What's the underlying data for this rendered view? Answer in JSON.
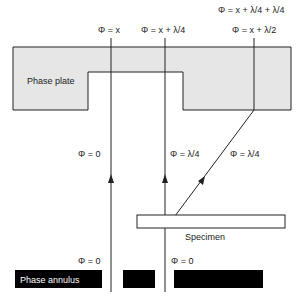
{
  "diagram": {
    "labels": {
      "phase_plate": "Phase plate",
      "specimen": "Specimen",
      "phase_annulus": "Phase annulus"
    },
    "top_phases": {
      "left": "Φ = x",
      "middle": "Φ = x + λ/4",
      "right": "Φ = x + λ/2",
      "far_right": "Φ = x + λ/4 + λ/4"
    },
    "mid_phases": {
      "left": "Φ = 0",
      "middle": "Φ = λ/4",
      "diffracted": "Φ = λ/4"
    },
    "bottom_phases": {
      "left": "Φ = 0",
      "right": "Φ = 0"
    },
    "colors": {
      "plate_fill": "#e6e6e6",
      "stroke": "#222222",
      "annulus": "#000000"
    }
  }
}
